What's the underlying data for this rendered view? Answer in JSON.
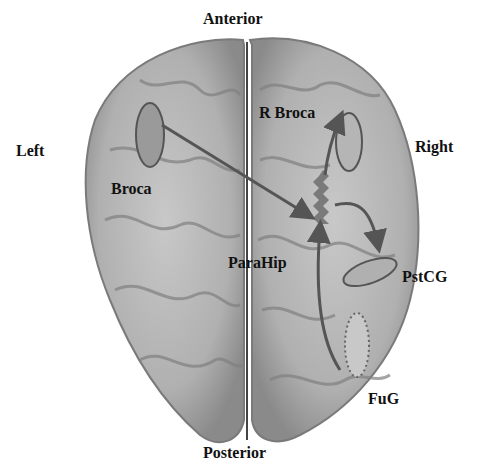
{
  "orientation": {
    "top": "Anterior",
    "bottom": "Posterior",
    "left": "Left",
    "right": "Right"
  },
  "regions": [
    {
      "id": "broca",
      "label": "Broca"
    },
    {
      "id": "r-broca",
      "label": "R Broca"
    },
    {
      "id": "parahip",
      "label": "ParaHip"
    },
    {
      "id": "pstcg",
      "label": "PstCG"
    },
    {
      "id": "fug",
      "label": "FuG"
    }
  ],
  "colors": {
    "brain_fill": "#b8b8b8",
    "region_fill": "#9a9a9a",
    "region_stroke": "#555555",
    "arrow": "#555555",
    "text": "#111111"
  }
}
